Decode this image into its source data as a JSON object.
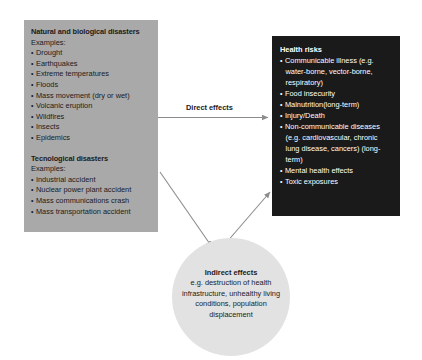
{
  "diagram": {
    "hazards_box": {
      "groups": [
        {
          "title": "Natural and biological disasters",
          "subtitle": "Examples:",
          "items": [
            "Drought",
            "Earthquakes",
            "Extreme temperatures",
            "Floods",
            "Mass movement (dry or wet)",
            "Volcanic eruption",
            "Wildfires",
            "Insects",
            "Epidemics"
          ]
        },
        {
          "title": "Tecnological disasters",
          "subtitle": "Examples:",
          "items": [
            "Industrial accident",
            "Nuclear power plant accident",
            "Mass communications crash",
            "Mass transportation accident"
          ]
        }
      ]
    },
    "health_box": {
      "title": "Health risks",
      "items": [
        "Communicable illness (e.g. water-borne, vector-borne, respiratory)",
        "Food insecurity",
        "Malnutrition(long-term)",
        "Injury/Death",
        "Non-communicable diseases (e.g. cardiovascular, chronic lung disease, cancers) (long-term)",
        "Mental health effects",
        "Toxic exposures"
      ]
    },
    "indirect_circle": {
      "title": "Indirect effects",
      "body": "e.g. destruction of health infrastructure, unhealthy living conditions, population displacement"
    },
    "arrows": {
      "direct_effects_label": "Direct effects"
    },
    "colors": {
      "hazards_fill": "#a9a9a9",
      "health_fill": "#1a1a1a",
      "circle_fill": "#e2e2e2",
      "arrow_stroke": "#8c8c8c",
      "text_dark": "#1b1b1b",
      "text_light": "#ffffff"
    }
  }
}
